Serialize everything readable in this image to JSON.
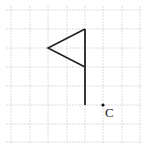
{
  "diagram": {
    "type": "grid-figure",
    "grid": {
      "x_lines": [
        11,
        30,
        48,
        67,
        85,
        103,
        122,
        140
      ],
      "y_lines": [
        10,
        29,
        48,
        67,
        86,
        105,
        124,
        142
      ],
      "color": "#d4d4d4"
    },
    "flag": {
      "pole": {
        "x": 85,
        "y_top": 29,
        "y_bottom": 105
      },
      "triangle": [
        [
          85,
          29
        ],
        [
          48,
          48
        ],
        [
          85,
          67
        ]
      ],
      "color": "#222222"
    },
    "point": {
      "label": "C",
      "x": 103,
      "y": 105
    }
  }
}
